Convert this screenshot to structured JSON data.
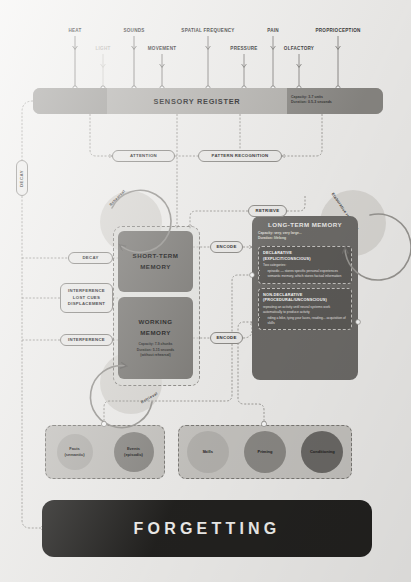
{
  "diagram": {
    "colors": {
      "background": "#f2f1ef",
      "sensory_bar": "#a8a6a2",
      "stm_box": "#7e7c78",
      "ltm_box": "#6f6d6a",
      "forgetting_bar": "#232220",
      "chip_fill": "#efeeec",
      "dim_label": "#b9b7b3"
    }
  },
  "inputs": {
    "label": "Sensory inputs",
    "items": [
      {
        "name": "HEAT",
        "x": 75,
        "row": 0,
        "dim": false
      },
      {
        "name": "LIGHT",
        "x": 103,
        "row": 1,
        "dim": true
      },
      {
        "name": "SOUNDS",
        "x": 134,
        "row": 0,
        "dim": false
      },
      {
        "name": "MOVEMENT",
        "x": 162,
        "row": 1,
        "dim": false
      },
      {
        "name": "SPATIAL FREQUENCY",
        "x": 208,
        "row": 0,
        "dim": false
      },
      {
        "name": "PRESSURE",
        "x": 244,
        "row": 1,
        "dim": false
      },
      {
        "name": "PAIN",
        "x": 273,
        "row": 0,
        "dim": false
      },
      {
        "name": "OLFACTORY",
        "x": 299,
        "row": 1,
        "dim": false
      },
      {
        "name": "PROPRIOCEPTION",
        "x": 338,
        "row": 0,
        "dim": false
      }
    ]
  },
  "sensory_register": {
    "title": "SENSORY REGISTER",
    "capacity": "Capacity: 3-7 units",
    "duration": "Duration: 0.5-3 seconds"
  },
  "process_chips": {
    "attention": "ATTENTION",
    "pattern_recognition": "PATTERN RECOGNITION",
    "retrieve": "RETRIEVE",
    "encode_stm": "ENCODE",
    "encode_wm": "ENCODE",
    "decay_side": "DECAY",
    "decay_stm": "DECAY",
    "interference_block": "INTERFERENCE\nLOST CUES\nDISPLACEMENT",
    "interference_block_lines": [
      "INTERFERENCE",
      "LOST CUES",
      "DISPLACEMENT"
    ],
    "interference_wm": "INTERFERENCE"
  },
  "arcs": {
    "rehearsal": "Rehearsal",
    "retrieval": "Retrieval",
    "elaborative_rehearsal": "Elaborative rehearsal"
  },
  "short_term_memory": {
    "title_line1": "SHORT-TERM",
    "title_line2": "MEMORY"
  },
  "working_memory": {
    "title_line1": "WORKING",
    "title_line2": "MEMORY",
    "capacity": "Capacity: 7-9 chunks",
    "duration": "Duration: 5-15 seconds",
    "note": "(without rehearsal)"
  },
  "long_term_memory": {
    "title": "LONG-TERM MEMORY",
    "capacity": "Capacity: very, very large...",
    "duration": "Duration: lifelong",
    "declarative": {
      "heading_line1": "DECLARATIVE",
      "heading_line2": "(EXPLICIT/CONSCIOUS)",
      "intro": "Two categories:",
      "bullets": [
        "episodic — stores specific personal experiences",
        "semantic memory, which stores factual information"
      ]
    },
    "non_declarative": {
      "heading_line1": "NON-DECLARATIVE",
      "heading_line2": "(PROCEDURAL/UNCONSCIOUS)",
      "intro": "repeating an activity until neural systems work automatically to produce activity",
      "bullets": [
        "riding a bike, tying your laces, reading... acquisition of skills"
      ]
    }
  },
  "declarative_group": {
    "items": [
      {
        "line1": "Facts",
        "line2": "(semantic)",
        "tone": "light",
        "size": 36
      },
      {
        "line1": "Events",
        "line2": "(episodic)",
        "tone": "mid",
        "size": 40
      }
    ]
  },
  "non_declarative_group": {
    "items": [
      {
        "line1": "Skills",
        "line2": "",
        "tone": "light",
        "size": 42
      },
      {
        "line1": "Priming",
        "line2": "",
        "tone": "mid",
        "size": 42
      },
      {
        "line1": "Conditioning",
        "line2": "",
        "tone": "dark",
        "size": 42
      }
    ]
  },
  "forgetting": {
    "label": "FORGETTING"
  }
}
